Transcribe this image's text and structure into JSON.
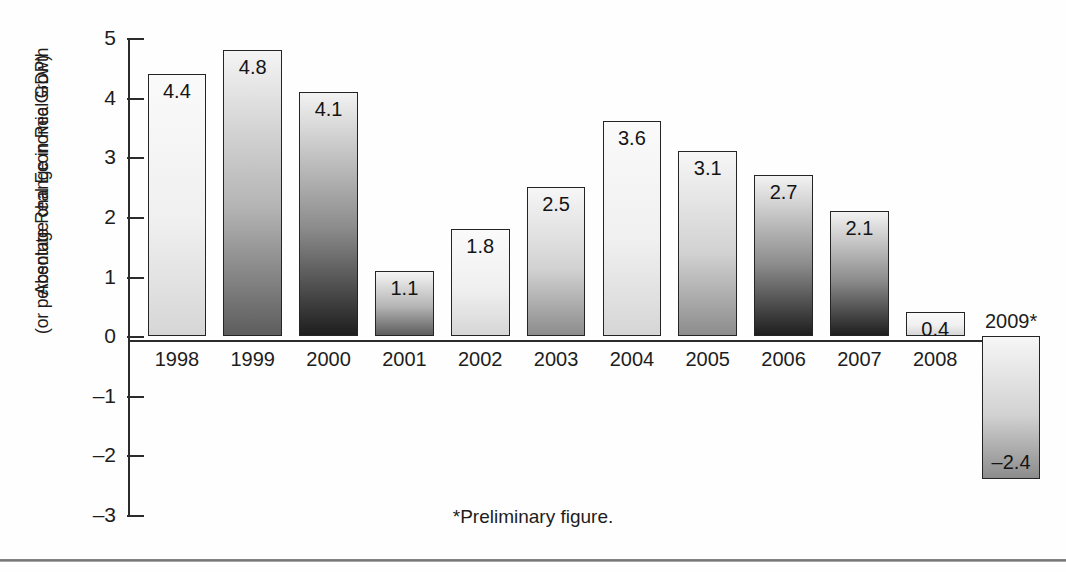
{
  "chart_data": {
    "type": "bar",
    "title": "",
    "subtitle": "",
    "xlabel": "",
    "ylabel_line1": "Absolute Real Economic Growth",
    "ylabel_line2": "(or percentage change in Real GDP)",
    "categories": [
      "1998",
      "1999",
      "2000",
      "2001",
      "2002",
      "2003",
      "2004",
      "2005",
      "2006",
      "2007",
      "2008",
      "2009*"
    ],
    "values": [
      4.4,
      4.8,
      4.1,
      1.1,
      1.8,
      2.5,
      3.6,
      3.1,
      2.7,
      2.1,
      0.4,
      -2.4
    ],
    "value_labels": [
      "4.4",
      "4.8",
      "4.1",
      "1.1",
      "1.8",
      "2.5",
      "3.6",
      "3.1",
      "2.7",
      "2.1",
      "0.4",
      "–2.4"
    ],
    "ylim": [
      -3,
      5
    ],
    "yticks": [
      5,
      4,
      3,
      2,
      1,
      0,
      -1,
      -2,
      -3
    ],
    "ytick_labels": [
      "5",
      "4",
      "3",
      "2",
      "1",
      "0",
      "–1",
      "–2",
      "–3"
    ],
    "grid": false,
    "legend": false,
    "footnote": "*Preliminary figure.",
    "bar_shading": [
      "light",
      "dark",
      "darkest",
      "dark",
      "light",
      "medium",
      "light",
      "medium",
      "darkest",
      "darkest",
      "light",
      "medium"
    ],
    "colors": {
      "axis": "#2b2b2b",
      "bar_outline": "#242424",
      "text": "#1d1d1d",
      "background": "#ffffff"
    }
  }
}
